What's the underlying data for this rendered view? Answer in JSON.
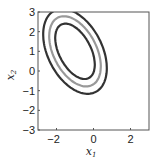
{
  "chart_data": {
    "type": "contour",
    "title": "",
    "xlabel": "x",
    "xlabel_sub": "1",
    "ylabel": "x",
    "ylabel_sub": "2",
    "xlim": [
      -3,
      3
    ],
    "ylim": [
      -3,
      3
    ],
    "xticks": [
      -2,
      0,
      2
    ],
    "yticks": [
      -3,
      -2,
      -1,
      0,
      1,
      2,
      3
    ],
    "grid": false,
    "legend": "none",
    "center": [
      -1,
      1
    ],
    "correlation": "negative",
    "contours": [
      {
        "name": "inner",
        "color": "#333333",
        "semi_axes": [
          1.55,
          0.85
        ],
        "angle_deg": -60
      },
      {
        "name": "middle",
        "color": "#999999",
        "semi_axes": [
          1.95,
          1.15
        ],
        "angle_deg": -60
      },
      {
        "name": "outer",
        "color": "#333333",
        "semi_axes": [
          2.35,
          1.45
        ],
        "angle_deg": -60
      }
    ]
  }
}
